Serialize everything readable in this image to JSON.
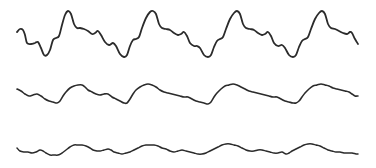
{
  "figure": {
    "background": "#ffffff",
    "stroke_color": "#2b2b2b",
    "traces": [
      {
        "name": "top-waveform",
        "stroke_width": 1.8,
        "points": [
          [
            17,
            32
          ],
          [
            20,
            29
          ],
          [
            23,
            30
          ],
          [
            25,
            35
          ],
          [
            27,
            43
          ],
          [
            31,
            44
          ],
          [
            35,
            43
          ],
          [
            38,
            42
          ],
          [
            41,
            48
          ],
          [
            44,
            55
          ],
          [
            47,
            55
          ],
          [
            50,
            50
          ],
          [
            53,
            40
          ],
          [
            56,
            38
          ],
          [
            59,
            36
          ],
          [
            62,
            25
          ],
          [
            65,
            15
          ],
          [
            68,
            11
          ],
          [
            71,
            14
          ],
          [
            74,
            24
          ],
          [
            77,
            28
          ],
          [
            80,
            28
          ],
          [
            84,
            29
          ],
          [
            88,
            31
          ],
          [
            92,
            34
          ],
          [
            95,
            33
          ],
          [
            98,
            31
          ],
          [
            101,
            35
          ],
          [
            105,
            42
          ],
          [
            109,
            45
          ],
          [
            113,
            43
          ],
          [
            116,
            46
          ],
          [
            120,
            54
          ],
          [
            124,
            57
          ],
          [
            127,
            55
          ],
          [
            130,
            46
          ],
          [
            133,
            40
          ],
          [
            136,
            39
          ],
          [
            139,
            37
          ],
          [
            142,
            28
          ],
          [
            146,
            18
          ],
          [
            150,
            12
          ],
          [
            153,
            11
          ],
          [
            156,
            14
          ],
          [
            159,
            24
          ],
          [
            162,
            28
          ],
          [
            166,
            29
          ],
          [
            170,
            30
          ],
          [
            174,
            33
          ],
          [
            178,
            35
          ],
          [
            181,
            34
          ],
          [
            184,
            32
          ],
          [
            187,
            36
          ],
          [
            190,
            43
          ],
          [
            194,
            46
          ],
          [
            197,
            46
          ],
          [
            200,
            48
          ],
          [
            204,
            55
          ],
          [
            208,
            57
          ],
          [
            211,
            55
          ],
          [
            214,
            47
          ],
          [
            217,
            41
          ],
          [
            220,
            39
          ],
          [
            223,
            37
          ],
          [
            226,
            29
          ],
          [
            230,
            19
          ],
          [
            234,
            13
          ],
          [
            237,
            11
          ],
          [
            240,
            14
          ],
          [
            243,
            24
          ],
          [
            246,
            28
          ],
          [
            250,
            29
          ],
          [
            254,
            30
          ],
          [
            258,
            33
          ],
          [
            262,
            35
          ],
          [
            265,
            34
          ],
          [
            268,
            32
          ],
          [
            271,
            36
          ],
          [
            274,
            43
          ],
          [
            278,
            46
          ],
          [
            282,
            45
          ],
          [
            285,
            48
          ],
          [
            289,
            55
          ],
          [
            293,
            57
          ],
          [
            296,
            55
          ],
          [
            299,
            47
          ],
          [
            302,
            41
          ],
          [
            305,
            39
          ],
          [
            308,
            37
          ],
          [
            311,
            29
          ],
          [
            315,
            19
          ],
          [
            319,
            13
          ],
          [
            322,
            11
          ],
          [
            325,
            14
          ],
          [
            328,
            24
          ],
          [
            331,
            28
          ],
          [
            335,
            29
          ],
          [
            339,
            31
          ],
          [
            343,
            33
          ],
          [
            347,
            34
          ],
          [
            350,
            32
          ],
          [
            352,
            33
          ],
          [
            355,
            39
          ],
          [
            358,
            44
          ]
        ]
      },
      {
        "name": "middle-waveform",
        "stroke_width": 1.6,
        "points": [
          [
            17,
            89
          ],
          [
            21,
            91
          ],
          [
            25,
            94
          ],
          [
            29,
            96
          ],
          [
            33,
            95
          ],
          [
            37,
            94
          ],
          [
            41,
            96
          ],
          [
            45,
            99
          ],
          [
            49,
            101
          ],
          [
            53,
            102
          ],
          [
            57,
            103
          ],
          [
            60,
            101
          ],
          [
            63,
            96
          ],
          [
            66,
            92
          ],
          [
            70,
            88
          ],
          [
            74,
            86
          ],
          [
            78,
            85
          ],
          [
            82,
            85
          ],
          [
            85,
            87
          ],
          [
            88,
            90
          ],
          [
            92,
            92
          ],
          [
            96,
            94
          ],
          [
            100,
            95
          ],
          [
            104,
            94
          ],
          [
            108,
            94
          ],
          [
            112,
            97
          ],
          [
            116,
            99
          ],
          [
            120,
            101
          ],
          [
            124,
            103
          ],
          [
            127,
            103
          ],
          [
            130,
            99
          ],
          [
            133,
            94
          ],
          [
            136,
            90
          ],
          [
            140,
            87
          ],
          [
            144,
            85
          ],
          [
            148,
            84
          ],
          [
            152,
            85
          ],
          [
            156,
            87
          ],
          [
            160,
            90
          ],
          [
            164,
            92
          ],
          [
            168,
            93
          ],
          [
            172,
            94
          ],
          [
            176,
            95
          ],
          [
            180,
            96
          ],
          [
            184,
            97
          ],
          [
            188,
            97
          ],
          [
            192,
            99
          ],
          [
            196,
            101
          ],
          [
            200,
            102
          ],
          [
            204,
            103
          ],
          [
            208,
            104
          ],
          [
            211,
            102
          ],
          [
            214,
            97
          ],
          [
            217,
            93
          ],
          [
            221,
            89
          ],
          [
            225,
            86
          ],
          [
            229,
            85
          ],
          [
            233,
            84
          ],
          [
            237,
            85
          ],
          [
            241,
            87
          ],
          [
            245,
            89
          ],
          [
            249,
            91
          ],
          [
            253,
            92
          ],
          [
            257,
            93
          ],
          [
            261,
            94
          ],
          [
            265,
            95
          ],
          [
            269,
            96
          ],
          [
            273,
            97
          ],
          [
            277,
            97
          ],
          [
            281,
            99
          ],
          [
            285,
            101
          ],
          [
            289,
            102
          ],
          [
            293,
            103
          ],
          [
            296,
            103
          ],
          [
            299,
            101
          ],
          [
            302,
            97
          ],
          [
            305,
            93
          ],
          [
            309,
            89
          ],
          [
            313,
            86
          ],
          [
            317,
            85
          ],
          [
            321,
            84
          ],
          [
            325,
            85
          ],
          [
            329,
            86
          ],
          [
            333,
            88
          ],
          [
            337,
            89
          ],
          [
            341,
            90
          ],
          [
            345,
            91
          ],
          [
            349,
            92
          ],
          [
            352,
            94
          ],
          [
            355,
            96
          ],
          [
            358,
            96
          ]
        ]
      },
      {
        "name": "bottom-waveform",
        "stroke_width": 1.5,
        "points": [
          [
            17,
            148
          ],
          [
            20,
            151
          ],
          [
            24,
            152
          ],
          [
            28,
            152
          ],
          [
            32,
            153
          ],
          [
            36,
            152
          ],
          [
            40,
            150
          ],
          [
            43,
            151
          ],
          [
            46,
            153
          ],
          [
            50,
            155
          ],
          [
            54,
            155
          ],
          [
            58,
            155
          ],
          [
            62,
            153
          ],
          [
            66,
            150
          ],
          [
            70,
            147
          ],
          [
            74,
            145
          ],
          [
            78,
            145
          ],
          [
            82,
            145
          ],
          [
            86,
            146
          ],
          [
            90,
            148
          ],
          [
            93,
            150
          ],
          [
            97,
            151
          ],
          [
            100,
            151
          ],
          [
            104,
            150
          ],
          [
            108,
            149
          ],
          [
            111,
            150
          ],
          [
            114,
            152
          ],
          [
            118,
            153
          ],
          [
            122,
            154
          ],
          [
            126,
            153
          ],
          [
            130,
            152
          ],
          [
            134,
            150
          ],
          [
            138,
            148
          ],
          [
            142,
            146
          ],
          [
            146,
            145
          ],
          [
            150,
            145
          ],
          [
            154,
            145
          ],
          [
            158,
            146
          ],
          [
            162,
            148
          ],
          [
            166,
            149
          ],
          [
            170,
            151
          ],
          [
            174,
            152
          ],
          [
            178,
            151
          ],
          [
            182,
            150
          ],
          [
            186,
            151
          ],
          [
            190,
            152
          ],
          [
            194,
            153
          ],
          [
            198,
            154
          ],
          [
            202,
            154
          ],
          [
            206,
            153
          ],
          [
            210,
            151
          ],
          [
            214,
            149
          ],
          [
            218,
            147
          ],
          [
            222,
            145
          ],
          [
            226,
            144
          ],
          [
            230,
            144
          ],
          [
            234,
            145
          ],
          [
            238,
            146
          ],
          [
            242,
            148
          ],
          [
            246,
            150
          ],
          [
            250,
            151
          ],
          [
            254,
            151
          ],
          [
            258,
            150
          ],
          [
            262,
            150
          ],
          [
            266,
            151
          ],
          [
            270,
            152
          ],
          [
            274,
            153
          ],
          [
            278,
            153
          ],
          [
            282,
            152
          ],
          [
            286,
            154
          ],
          [
            289,
            153
          ],
          [
            292,
            151
          ],
          [
            296,
            149
          ],
          [
            300,
            147
          ],
          [
            304,
            145
          ],
          [
            308,
            144
          ],
          [
            312,
            144
          ],
          [
            316,
            145
          ],
          [
            320,
            146
          ],
          [
            324,
            148
          ],
          [
            328,
            150
          ],
          [
            332,
            151
          ],
          [
            336,
            152
          ],
          [
            340,
            152
          ],
          [
            344,
            153
          ],
          [
            348,
            153
          ],
          [
            352,
            153
          ],
          [
            356,
            154
          ],
          [
            358,
            154
          ]
        ]
      }
    ]
  }
}
